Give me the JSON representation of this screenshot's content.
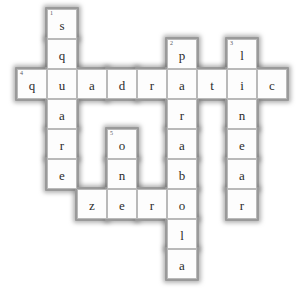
{
  "puzzle": {
    "type": "crossword",
    "title": "Algebra crossword grid",
    "grid": {
      "columns": 9,
      "rows": 9,
      "cell_size": 30,
      "origin_x": 17,
      "origin_y": 9
    },
    "entries": [
      {
        "number": "1",
        "direction": "down",
        "answer": "square",
        "start_col": 1,
        "start_row": 0
      },
      {
        "number": "2",
        "direction": "down",
        "answer": "parabola",
        "start_col": 5,
        "start_row": 1
      },
      {
        "number": "3",
        "direction": "down",
        "answer": "linear",
        "start_col": 7,
        "start_row": 1
      },
      {
        "number": "4",
        "direction": "across",
        "answer": "quadratic",
        "start_col": 0,
        "start_row": 2
      },
      {
        "number": "5",
        "direction": "down",
        "answer": "one",
        "start_col": 3,
        "start_row": 4
      },
      {
        "number": "6",
        "direction": "across",
        "answer": "zero",
        "start_col": 2,
        "start_row": 6
      }
    ],
    "cells": [
      {
        "col": 1,
        "row": 0,
        "letter": "s",
        "number": "1"
      },
      {
        "col": 1,
        "row": 1,
        "letter": "q",
        "number": ""
      },
      {
        "col": 5,
        "row": 1,
        "letter": "p",
        "number": "2"
      },
      {
        "col": 7,
        "row": 1,
        "letter": "l",
        "number": "3"
      },
      {
        "col": 0,
        "row": 2,
        "letter": "q",
        "number": "4"
      },
      {
        "col": 1,
        "row": 2,
        "letter": "u",
        "number": ""
      },
      {
        "col": 2,
        "row": 2,
        "letter": "a",
        "number": ""
      },
      {
        "col": 3,
        "row": 2,
        "letter": "d",
        "number": ""
      },
      {
        "col": 4,
        "row": 2,
        "letter": "r",
        "number": ""
      },
      {
        "col": 5,
        "row": 2,
        "letter": "a",
        "number": ""
      },
      {
        "col": 6,
        "row": 2,
        "letter": "t",
        "number": ""
      },
      {
        "col": 7,
        "row": 2,
        "letter": "i",
        "number": ""
      },
      {
        "col": 8,
        "row": 2,
        "letter": "c",
        "number": ""
      },
      {
        "col": 1,
        "row": 3,
        "letter": "a",
        "number": ""
      },
      {
        "col": 5,
        "row": 3,
        "letter": "r",
        "number": ""
      },
      {
        "col": 7,
        "row": 3,
        "letter": "n",
        "number": ""
      },
      {
        "col": 1,
        "row": 4,
        "letter": "r",
        "number": ""
      },
      {
        "col": 3,
        "row": 4,
        "letter": "o",
        "number": "5"
      },
      {
        "col": 5,
        "row": 4,
        "letter": "a",
        "number": ""
      },
      {
        "col": 7,
        "row": 4,
        "letter": "e",
        "number": ""
      },
      {
        "col": 1,
        "row": 5,
        "letter": "e",
        "number": ""
      },
      {
        "col": 3,
        "row": 5,
        "letter": "n",
        "number": ""
      },
      {
        "col": 5,
        "row": 5,
        "letter": "b",
        "number": ""
      },
      {
        "col": 7,
        "row": 5,
        "letter": "a",
        "number": ""
      },
      {
        "col": 2,
        "row": 6,
        "letter": "z",
        "number": ""
      },
      {
        "col": 3,
        "row": 6,
        "letter": "e",
        "number": ""
      },
      {
        "col": 4,
        "row": 6,
        "letter": "r",
        "number": ""
      },
      {
        "col": 5,
        "row": 6,
        "letter": "o",
        "number": ""
      },
      {
        "col": 7,
        "row": 6,
        "letter": "r",
        "number": ""
      },
      {
        "col": 5,
        "row": 7,
        "letter": "l",
        "number": ""
      },
      {
        "col": 5,
        "row": 8,
        "letter": "a",
        "number": ""
      }
    ],
    "colors": {
      "cell_fill": "#fdfdfd",
      "cell_border": "#b9b9b9",
      "letter_color": "#2b2b2b",
      "number_color": "#55555e",
      "halo_color": "#9a9a9a",
      "page_background": "#ffffff"
    }
  }
}
